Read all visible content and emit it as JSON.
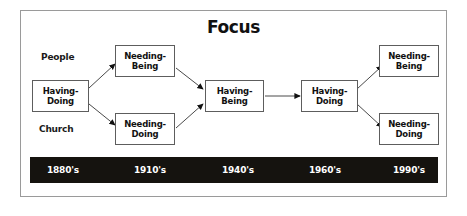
{
  "diagram": {
    "title": "Focus",
    "side_labels": [
      {
        "name": "people",
        "text": "People"
      },
      {
        "name": "church",
        "text": "Church"
      }
    ],
    "nodes": [
      {
        "id": "having-doing-1",
        "line1": "Having-",
        "line2": "Doing"
      },
      {
        "id": "needing-being-1",
        "line1": "Needing-",
        "line2": "Being"
      },
      {
        "id": "needing-doing-1",
        "line1": "Needing-",
        "line2": "Doing"
      },
      {
        "id": "having-being-center",
        "line1": "Having-",
        "line2": "Being"
      },
      {
        "id": "having-doing-2",
        "line1": "Having-",
        "line2": "Doing"
      },
      {
        "id": "needing-being-2",
        "line1": "Needing-",
        "line2": "Being"
      },
      {
        "id": "needing-doing-2",
        "line1": "Needing-",
        "line2": "Doing"
      }
    ],
    "timeline": {
      "ticks": [
        "1880's",
        "1910's",
        "1940's",
        "1960's",
        "1990's"
      ]
    },
    "colors": {
      "frame_border": "#9a9a9a",
      "box_border": "#5d5d5d",
      "timeline_bg": "#15130f",
      "timeline_text": "#ffffff",
      "text": "#111111"
    }
  }
}
